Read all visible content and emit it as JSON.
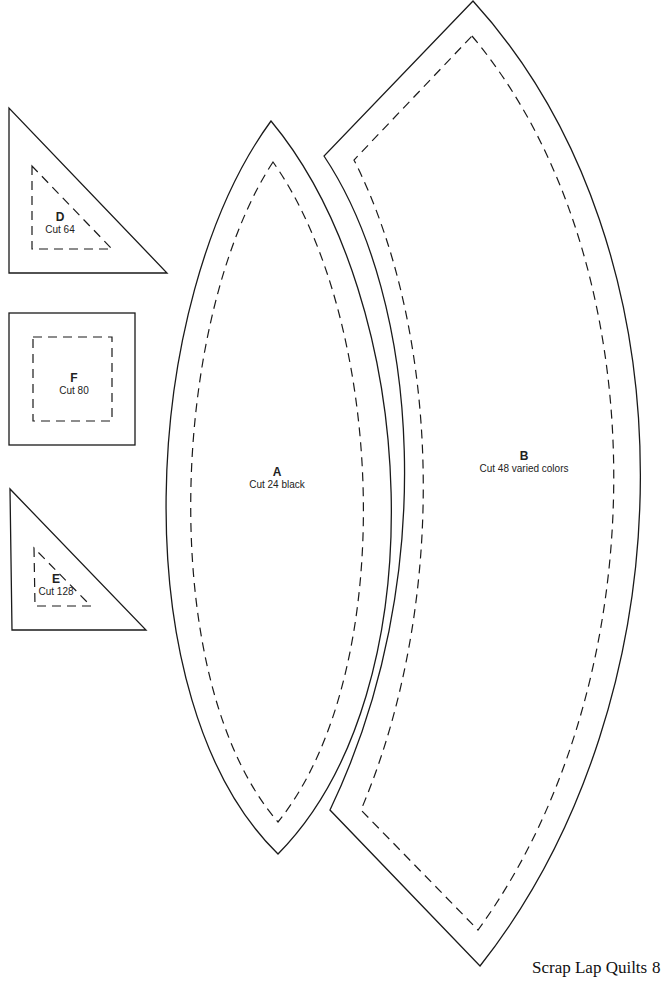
{
  "pieces": {
    "A": {
      "letter": "A",
      "cut": "Cut 24 black"
    },
    "B": {
      "letter": "B",
      "cut": "Cut 48 varied colors"
    },
    "D": {
      "letter": "D",
      "cut": "Cut 64"
    },
    "E": {
      "letter": "E",
      "cut": "Cut 128"
    },
    "F": {
      "letter": "F",
      "cut": "Cut 80"
    }
  },
  "footer": {
    "title": "Scrap Lap Quilts",
    "page_number": "8"
  },
  "colors": {
    "line": "#1a1a1a",
    "background": "#ffffff"
  }
}
